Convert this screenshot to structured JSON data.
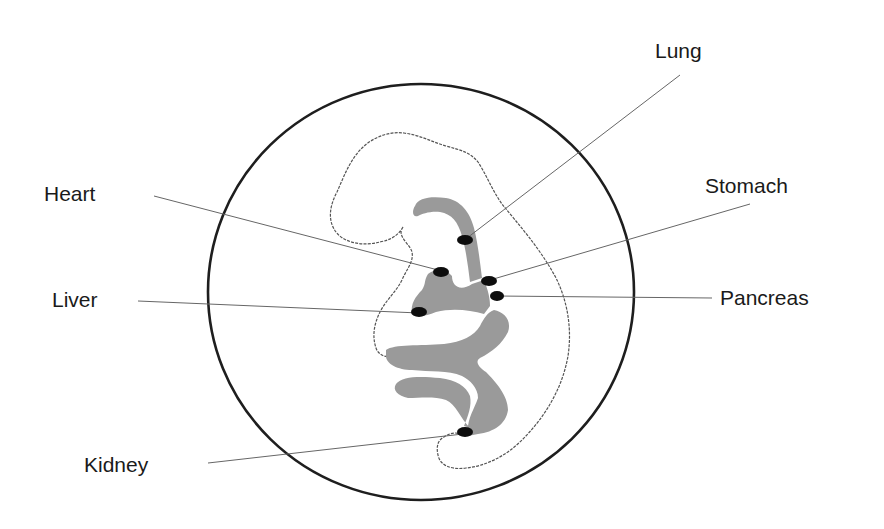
{
  "diagram": {
    "colors": {
      "circle": "#1e1e1e",
      "outline": "#555555",
      "gut_tube": "#9a9a9a",
      "organ_dot": "#0d0d0d",
      "leader_line": "#666666",
      "label_text": "#1a1a1a"
    },
    "labels": [
      {
        "id": "lung",
        "text": "Lung",
        "x": 655,
        "y": 40
      },
      {
        "id": "heart",
        "text": "Heart",
        "x": 44,
        "y": 183
      },
      {
        "id": "stomach",
        "text": "Stomach",
        "x": 705,
        "y": 175
      },
      {
        "id": "liver",
        "text": "Liver",
        "x": 52,
        "y": 289
      },
      {
        "id": "pancreas",
        "text": "Pancreas",
        "x": 720,
        "y": 287
      },
      {
        "id": "kidney",
        "text": "Kidney",
        "x": 84,
        "y": 454
      }
    ]
  }
}
